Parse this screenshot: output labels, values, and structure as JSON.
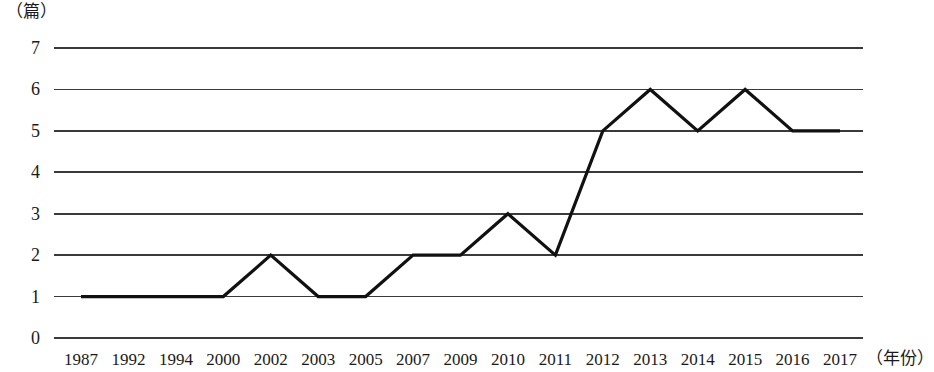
{
  "chart_data": {
    "type": "line",
    "title": "",
    "subtitle": "",
    "xlabel": "（年份）",
    "ylabel": "（篇）",
    "categories": [
      "1987",
      "1992",
      "1994",
      "2000",
      "2002",
      "2003",
      "2005",
      "2007",
      "2009",
      "2010",
      "2011",
      "2012",
      "2013",
      "2014",
      "2015",
      "2016",
      "2017"
    ],
    "values": [
      1,
      1,
      1,
      1,
      2,
      1,
      1,
      2,
      2,
      3,
      2,
      5,
      6,
      5,
      6,
      5,
      5
    ],
    "series": [
      {
        "name": "",
        "values": [
          1,
          1,
          1,
          1,
          2,
          1,
          1,
          2,
          2,
          3,
          2,
          5,
          6,
          5,
          6,
          5,
          5
        ]
      }
    ],
    "ylim": [
      0,
      7
    ],
    "yticks": [
      0,
      1,
      2,
      3,
      4,
      5,
      6,
      7
    ],
    "ytick_labels": [
      "0",
      "1",
      "2",
      "3",
      "4",
      "5",
      "6",
      "7"
    ],
    "grid": true,
    "grid_axis": "y",
    "legend": false,
    "legend_position": "none",
    "line_color": "#111111",
    "grid_color": "#3a3a3a",
    "background_color": "#ffffff",
    "markers": false,
    "annotations": []
  },
  "axis": {
    "unit_label": "（篇）",
    "x_axis_title": "（年份）"
  }
}
